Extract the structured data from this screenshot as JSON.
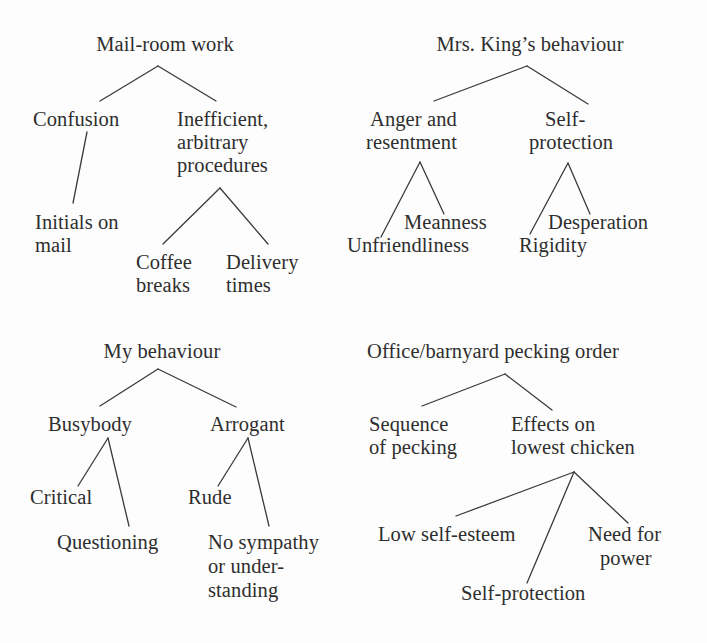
{
  "diagram": {
    "type": "concept-tree-cluster",
    "text_color": "#2e2e2e",
    "background_color": "#fdfdfd",
    "line_color": "#3a3a3a",
    "trees": [
      {
        "id": "mail-room-work",
        "root": "Mail-room work",
        "nodes": [
          "Confusion",
          "Initials on\nmail",
          "Inefficient,\narbitrary\nprocedures",
          "Coffee\nbreaks",
          "Delivery\ntimes"
        ]
      },
      {
        "id": "mrs-kings-behaviour",
        "root": "Mrs. King’s behaviour",
        "nodes": [
          "Anger and\nresentment",
          "Unfriendliness",
          "Meanness",
          "Self-\nprotection",
          "Rigidity",
          "Desperation"
        ]
      },
      {
        "id": "my-behaviour",
        "root": "My behaviour",
        "nodes": [
          "Busybody",
          "Critical",
          "Questioning",
          "Arrogant",
          "Rude",
          "No sympathy\nor under-\nstanding"
        ]
      },
      {
        "id": "office-barnyard-pecking-order",
        "root": "Office/barnyard pecking order",
        "nodes": [
          "Sequence\nof pecking",
          "Effects on\nlowest chicken",
          "Low self-esteem",
          "Self-protection",
          "Need for\npower"
        ]
      }
    ]
  },
  "tree1": {
    "root": "Mail-room work",
    "confusion": "Confusion",
    "initials_line1": "Initials on",
    "initials_line2": "mail",
    "inefficient_line1": "Inefficient,",
    "inefficient_line2": "arbitrary",
    "inefficient_line3": "procedures",
    "coffee_line1": "Coffee",
    "coffee_line2": "breaks",
    "delivery_line1": "Delivery",
    "delivery_line2": "times"
  },
  "tree2": {
    "root": "Mrs. King’s behaviour",
    "anger_line1": "Anger and",
    "anger_line2": "resentment",
    "unfriendliness": "Unfriendliness",
    "meanness": "Meanness",
    "self_line1": "Self-",
    "self_line2": "protection",
    "rigidity": "Rigidity",
    "desperation": "Desperation"
  },
  "tree3": {
    "root": "My behaviour",
    "busybody": "Busybody",
    "critical": "Critical",
    "questioning": "Questioning",
    "arrogant": "Arrogant",
    "rude": "Rude",
    "nosympathy_line1": "No sympathy",
    "nosympathy_line2": "or under-",
    "nosympathy_line3": "standing"
  },
  "tree4": {
    "root": "Office/barnyard pecking order",
    "sequence_line1": "Sequence",
    "sequence_line2": "of pecking",
    "effects_line1": "Effects on",
    "effects_line2": "lowest chicken",
    "low_self_esteem": "Low self-esteem",
    "self_protection": "Self-protection",
    "need_line1": "Need for",
    "need_line2": "power"
  }
}
